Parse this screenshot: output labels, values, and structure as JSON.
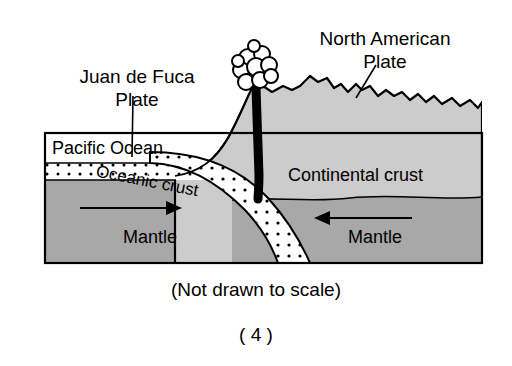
{
  "figure": {
    "title_absent": true,
    "labels": {
      "juan_de_fuca_line1": "Juan de Fuca",
      "juan_de_fuca_line2": "Plate",
      "north_american_line1": "North American",
      "north_american_line2": "Plate",
      "pacific_ocean": "Pacific Ocean",
      "oceanic_crust": "Oceanic crust",
      "continental_crust": "Continental crust",
      "mantle_left": "Mantle",
      "mantle_right": "Mantle"
    },
    "captions": {
      "scale_note": "(Not drawn to scale)",
      "choice_number": "( 4 )"
    },
    "colors": {
      "background": "#ffffff",
      "continental_crust_fill": "#cccccc",
      "mantle_fill": "#a8a8a8",
      "oceanic_crust_fill": "#ffffff",
      "slab_fill": "#ffffff",
      "magma_conduit": "#000000",
      "outline": "#000000",
      "ash_plume_fill": "#ffffff"
    },
    "icons": {
      "ash_plume": "volcano-ash-cloud-icon",
      "magma": "magma-conduit-icon",
      "arrow_left_region": "convection-arrow-right-icon",
      "arrow_right_region": "convection-arrow-left-icon"
    },
    "arrows": [
      {
        "name": "mantle-arrow-left",
        "direction": "right",
        "label_context": "Mantle"
      },
      {
        "name": "mantle-arrow-right",
        "direction": "left",
        "label_context": "Mantle"
      }
    ]
  }
}
